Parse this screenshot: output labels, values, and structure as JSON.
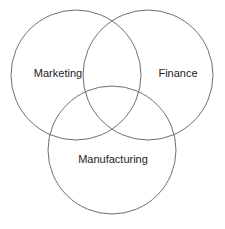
{
  "diagram": {
    "type": "venn",
    "title": "",
    "background_color": "#ffffff",
    "stroke_color": "#6f6f6f",
    "stroke_width": 1,
    "label_color": "#1c1c1c",
    "label_font_size": 11,
    "canvas": {
      "width": 225,
      "height": 229
    },
    "sets": [
      {
        "name": "marketing",
        "label": "Marketing",
        "cx": 76,
        "cy": 75,
        "r": 65,
        "label_x": 58,
        "label_y": 74
      },
      {
        "name": "finance",
        "label": "Finance",
        "cx": 148,
        "cy": 75,
        "r": 65,
        "label_x": 178,
        "label_y": 74
      },
      {
        "name": "manufacturing",
        "label": "Manufacturing",
        "cx": 112,
        "cy": 150,
        "r": 64,
        "label_x": 113,
        "label_y": 160
      }
    ]
  }
}
